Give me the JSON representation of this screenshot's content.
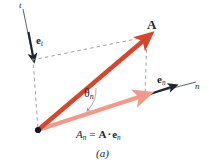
{
  "figure": {
    "caption": "(a)",
    "colors": {
      "vector_a": "#d6452c",
      "projection": "#ef9b8c",
      "axis": "#3c4152",
      "dashed": "#8d8d93",
      "text": "#222634",
      "background": "#ffffff"
    },
    "labels": {
      "vector_a": "A",
      "unit_vector_t": "e",
      "unit_vector_t_sub": "t",
      "unit_vector_n": "e",
      "unit_vector_n_sub": "n",
      "axis_t": "t",
      "axis_n": "n",
      "angle": "θ",
      "angle_sub": "n",
      "equation_lhs": "A",
      "equation_lhs_sub": "n",
      "equation_eq": "=",
      "equation_rhs_a": "A",
      "equation_dot": "·",
      "equation_rhs_e": "e",
      "equation_rhs_sub": "n"
    },
    "geometry": {
      "origin": [
        38,
        130
      ],
      "vector_a_tip": [
        147,
        36
      ],
      "projection_tip": [
        146,
        95
      ],
      "n_axis_end": [
        196,
        82
      ],
      "t_axis_top": [
        23,
        9
      ],
      "unit_t_tip": [
        33,
        58
      ],
      "unit_n_tip": [
        172,
        86
      ]
    },
    "icons": {
      "origin_dot": "origin-point-dot",
      "arrowhead_a": "arrowhead-vector-a",
      "arrowhead_projection": "arrowhead-projection",
      "arrowhead_unit_t": "arrowhead-unit-vector-t",
      "arrowhead_unit_n": "arrowhead-unit-vector-n",
      "angle_arc": "angle-arc-indicator"
    }
  }
}
